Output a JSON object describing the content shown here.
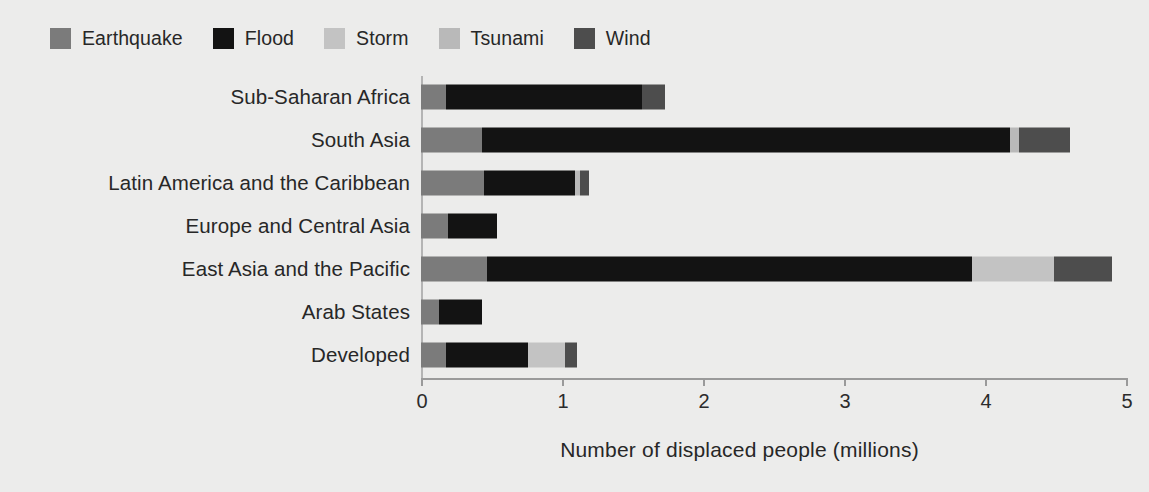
{
  "legend": {
    "position": "top-left",
    "items": [
      {
        "label": "Earthquake",
        "color": "#7b7b7b"
      },
      {
        "label": "Flood",
        "color": "#131313"
      },
      {
        "label": "Storm",
        "color": "#c3c3c3"
      },
      {
        "label": "Tsunami",
        "color": "#b9b9b9"
      },
      {
        "label": "Wind",
        "color": "#4d4d4d"
      }
    ]
  },
  "axis": {
    "ticks": [
      "0",
      "1",
      "2",
      "3",
      "4",
      "5"
    ],
    "title": "Number of displaced people (millions)"
  },
  "chart_data": {
    "type": "bar",
    "orientation": "horizontal",
    "stacked": true,
    "title": "",
    "subtitle": "",
    "xlabel": "Number of displaced people (millions)",
    "ylabel": "",
    "xlim": [
      0,
      5
    ],
    "xticks": [
      0,
      1,
      2,
      3,
      4,
      5
    ],
    "grid": false,
    "legend_position": "top-left",
    "categories": [
      "Sub-Saharan Africa",
      "South Asia",
      "Latin America and the Caribbean",
      "Europe and Central Asia",
      "East Asia and the Pacific",
      "Arab States",
      "Developed"
    ],
    "series": [
      {
        "name": "Earthquake",
        "color": "#7b7b7b",
        "values": [
          0.18,
          0.43,
          0.45,
          0.19,
          0.47,
          0.13,
          0.18
        ]
      },
      {
        "name": "Flood",
        "color": "#131313",
        "values": [
          1.39,
          3.75,
          0.64,
          0.35,
          3.44,
          0.3,
          0.58
        ]
      },
      {
        "name": "Storm",
        "color": "#c3c3c3",
        "values": [
          0.0,
          0.0,
          0.0,
          0.0,
          0.58,
          0.0,
          0.26
        ]
      },
      {
        "name": "Tsunami",
        "color": "#b9b9b9",
        "values": [
          0.0,
          0.06,
          0.04,
          0.0,
          0.0,
          0.0,
          0.0
        ]
      },
      {
        "name": "Wind",
        "color": "#4d4d4d",
        "values": [
          0.16,
          0.36,
          0.06,
          0.0,
          0.41,
          0.0,
          0.09
        ]
      }
    ],
    "totals": [
      1.73,
      4.6,
      1.19,
      0.54,
      4.9,
      0.43,
      1.11
    ]
  }
}
